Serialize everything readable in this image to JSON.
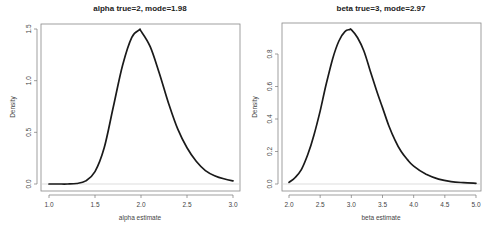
{
  "chart_data": [
    {
      "type": "line",
      "title": "alpha true=2, mode=1.98",
      "xlabel": "alpha estimate",
      "ylabel": "Density",
      "xlim": [
        1.0,
        3.0
      ],
      "ylim": [
        0.0,
        1.5
      ],
      "xticks": [
        "1.0",
        "1.5",
        "2.0",
        "2.5",
        "3.0"
      ],
      "yticks": [
        "0.0",
        "0.5",
        "1.0",
        "1.5"
      ],
      "grid": false,
      "zero_line": true,
      "x": [
        1.0,
        1.1,
        1.2,
        1.3,
        1.4,
        1.5,
        1.6,
        1.7,
        1.8,
        1.9,
        1.98,
        2.0,
        2.1,
        2.2,
        2.3,
        2.4,
        2.5,
        2.6,
        2.7,
        2.8,
        2.9,
        3.0
      ],
      "series": [
        {
          "name": "density",
          "values": [
            0.0,
            0.0,
            0.0,
            0.005,
            0.03,
            0.12,
            0.35,
            0.75,
            1.15,
            1.42,
            1.49,
            1.48,
            1.33,
            1.07,
            0.78,
            0.53,
            0.35,
            0.22,
            0.13,
            0.08,
            0.05,
            0.03
          ]
        }
      ]
    },
    {
      "type": "line",
      "title": "beta true=3, mode=2.97",
      "xlabel": "beta estimate",
      "ylabel": "Density",
      "xlim": [
        2.0,
        5.0
      ],
      "ylim": [
        0.0,
        0.95
      ],
      "xticks": [
        "2.0",
        "2.5",
        "3.0",
        "3.5",
        "4.0",
        "4.5",
        "5.0"
      ],
      "yticks": [
        "0.0",
        "0.2",
        "0.4",
        "0.6",
        "0.8"
      ],
      "grid": false,
      "zero_line": true,
      "x": [
        2.0,
        2.1,
        2.2,
        2.3,
        2.4,
        2.5,
        2.6,
        2.7,
        2.8,
        2.9,
        2.97,
        3.0,
        3.1,
        3.2,
        3.3,
        3.4,
        3.5,
        3.6,
        3.7,
        3.8,
        3.9,
        4.0,
        4.2,
        4.4,
        4.6,
        4.8,
        5.0
      ],
      "series": [
        {
          "name": "density",
          "values": [
            0.01,
            0.04,
            0.09,
            0.18,
            0.3,
            0.45,
            0.62,
            0.77,
            0.88,
            0.94,
            0.95,
            0.95,
            0.9,
            0.82,
            0.7,
            0.58,
            0.47,
            0.36,
            0.27,
            0.2,
            0.15,
            0.11,
            0.06,
            0.03,
            0.015,
            0.008,
            0.004
          ]
        }
      ]
    }
  ],
  "plots": [
    {
      "title": "alpha true=2, mode=1.98",
      "xlabel": "alpha estimate",
      "ylabel": "Density",
      "xticks": [
        "1.0",
        "1.5",
        "2.0",
        "2.5",
        "3.0"
      ],
      "yticks": [
        "0.0",
        "0.5",
        "1.0",
        "1.5"
      ]
    },
    {
      "title": "beta true=3, mode=2.97",
      "xlabel": "beta estimate",
      "ylabel": "Density",
      "xticks": [
        "2.0",
        "2.5",
        "3.0",
        "3.5",
        "4.0",
        "4.5",
        "5.0"
      ],
      "yticks": [
        "0.0",
        "0.2",
        "0.4",
        "0.6",
        "0.8"
      ]
    }
  ],
  "colors": {
    "curve": "#1a1a1a",
    "axis": "#777777",
    "zero_line": "#cfcfcf",
    "text": "#444444"
  }
}
